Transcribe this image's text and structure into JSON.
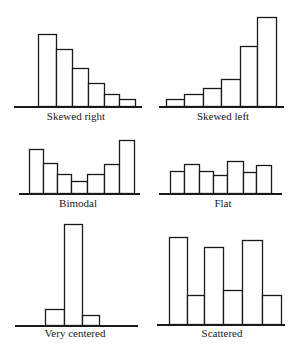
{
  "labels": {
    "skewed_right": "Skewed right",
    "skewed_left": "Skewed left",
    "bimodal": "Bimodal",
    "flat": "Flat",
    "very_centered": "Very centered",
    "scattered": "Scattered"
  },
  "colors": {
    "stroke": "#1a1a1a",
    "fill": "#ffffff"
  },
  "chart_data": [
    {
      "type": "bar",
      "title": "Skewed right",
      "values": [
        72,
        57,
        38,
        23,
        12,
        7
      ],
      "baseline_y": 106,
      "x_edges": [
        38,
        56,
        72,
        88,
        104,
        119,
        135
      ],
      "axis": [
        14,
        142
      ],
      "grid": false
    },
    {
      "type": "bar",
      "title": "Skewed left",
      "values": [
        7,
        12,
        18,
        27,
        60,
        89
      ],
      "baseline_y": 106,
      "x_edges": [
        166,
        184,
        203,
        221,
        240,
        257,
        276
      ],
      "axis": [
        159,
        284
      ],
      "grid": false
    },
    {
      "type": "bar",
      "title": "Bimodal",
      "values": [
        44,
        30,
        19,
        12,
        19,
        29,
        53
      ],
      "baseline_y": 193,
      "x_edges": [
        29,
        43,
        57,
        71,
        87,
        104,
        119,
        134
      ],
      "axis": [
        19,
        140
      ],
      "grid": false
    },
    {
      "type": "bar",
      "title": "Flat",
      "values": [
        22,
        29,
        22,
        18,
        32,
        21,
        28
      ],
      "baseline_y": 193,
      "x_edges": [
        170,
        184,
        199,
        213,
        227,
        243,
        256,
        271
      ],
      "axis": [
        159,
        282
      ],
      "grid": false
    },
    {
      "type": "bar",
      "title": "Very centered",
      "values": [
        16,
        101,
        10
      ],
      "baseline_y": 325,
      "x_edges": [
        45,
        64,
        82,
        99
      ],
      "axis": [
        15,
        138
      ],
      "grid": false
    },
    {
      "type": "bar",
      "title": "Scattered",
      "values": [
        87,
        29,
        77,
        34,
        84,
        29
      ],
      "baseline_y": 324,
      "x_edges": [
        169,
        187,
        204,
        223,
        242,
        262,
        281
      ],
      "axis": [
        157,
        285
      ],
      "grid": false
    }
  ]
}
